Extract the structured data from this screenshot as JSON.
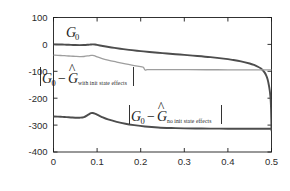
{
  "chart_data": {
    "type": "line",
    "title": "",
    "xlabel": "frequency",
    "ylabel": "Amplitude (dB)",
    "xlim": [
      0,
      0.5
    ],
    "ylim": [
      -400,
      100
    ],
    "xticks": [
      "0",
      "0.1",
      "0.2",
      "0.3",
      "0.4",
      "0.5"
    ],
    "xtick_values": [
      0,
      0.1,
      0.2,
      0.3,
      0.4,
      0.5
    ],
    "yticks": [
      "100",
      "0",
      "-100",
      "-200",
      "-300",
      "-400"
    ],
    "ytick_values": [
      100,
      0,
      -100,
      -200,
      -300,
      -400
    ],
    "grid": false,
    "legend_position": "none",
    "series": [
      {
        "name": "G_0",
        "color": "#4d4d4d",
        "width": 1.9,
        "x": [
          0.0,
          0.01,
          0.02,
          0.03,
          0.04,
          0.05,
          0.06,
          0.07,
          0.08,
          0.085,
          0.09,
          0.095,
          0.1,
          0.11,
          0.12,
          0.14,
          0.16,
          0.18,
          0.2,
          0.22,
          0.25,
          0.28,
          0.3,
          0.33,
          0.36,
          0.39,
          0.41,
          0.43,
          0.45,
          0.46,
          0.47,
          0.475,
          0.48,
          0.484,
          0.488,
          0.491,
          0.494,
          0.496,
          0.497,
          0.498,
          0.499,
          0.5
        ],
        "y": [
          0.0,
          -0.2,
          -0.6,
          -1.1,
          -1.7,
          -2.3,
          -2.6,
          -2.4,
          -1.3,
          -0.5,
          0.0,
          -0.6,
          -2.0,
          -5.0,
          -8.0,
          -13.0,
          -17.5,
          -21.5,
          -25.0,
          -28.2,
          -32.5,
          -36.5,
          -39.0,
          -43.0,
          -47.5,
          -53.0,
          -57.5,
          -63.0,
          -71.0,
          -76.5,
          -84.0,
          -89.0,
          -96.0,
          -104.0,
          -116.0,
          -130.0,
          -152.0,
          -172.0,
          -186.0,
          -205.0,
          -240.0,
          -320.0
        ]
      },
      {
        "name": "|G_0 - Ghat_with_init_state_effects|",
        "color": "#9e9e9e",
        "width": 1.3,
        "x": [
          0.0,
          0.01,
          0.02,
          0.03,
          0.04,
          0.05,
          0.06,
          0.07,
          0.08,
          0.086,
          0.09,
          0.095,
          0.1,
          0.11,
          0.125,
          0.145,
          0.165,
          0.185,
          0.2,
          0.206,
          0.21,
          0.215,
          0.225,
          0.25,
          0.28,
          0.31,
          0.35,
          0.4,
          0.44,
          0.47,
          0.49,
          0.5
        ],
        "y": [
          -40.0,
          -40.6,
          -41.6,
          -42.6,
          -43.6,
          -44.6,
          -45.4,
          -45.0,
          -42.5,
          -40.5,
          -41.0,
          -43.0,
          -46.5,
          -52.0,
          -58.5,
          -65.5,
          -72.0,
          -78.5,
          -83.0,
          -85.0,
          -95.0,
          -94.0,
          -93.5,
          -93.6,
          -93.8,
          -94.0,
          -94.2,
          -94.4,
          -94.6,
          -94.8,
          -95.0,
          -95.0
        ]
      },
      {
        "name": "|G_0 - Ghat_no_init_state_effects|",
        "color": "#4d4d4d",
        "width": 1.9,
        "x": [
          0.0,
          0.01,
          0.02,
          0.03,
          0.04,
          0.05,
          0.06,
          0.07,
          0.08,
          0.086,
          0.09,
          0.095,
          0.1,
          0.11,
          0.125,
          0.145,
          0.165,
          0.185,
          0.21,
          0.24,
          0.27,
          0.3,
          0.34,
          0.38,
          0.42,
          0.46,
          0.48,
          0.49,
          0.5
        ],
        "y": [
          -268.0,
          -268.5,
          -269.5,
          -270.5,
          -271.5,
          -272.5,
          -272.5,
          -270.0,
          -261.0,
          -255.5,
          -255.0,
          -257.0,
          -261.0,
          -269.0,
          -279.0,
          -288.0,
          -295.0,
          -300.0,
          -305.0,
          -309.0,
          -311.0,
          -312.0,
          -312.8,
          -313.2,
          -313.5,
          -313.7,
          -313.8,
          -313.8,
          -313.8
        ]
      }
    ],
    "annotations": [
      {
        "id": "g0-label",
        "text": "G₀",
        "base": "G",
        "sub": "0",
        "x": 0.5,
        "y": 57
      },
      {
        "id": "with-init-label",
        "text": "|G₀ − Ĝ with init state effects|",
        "base_left": "G",
        "sub_left": "0",
        "minus": "−",
        "base_right": "G",
        "sub_right": "with init state effects",
        "x": 0.05,
        "y": -108
      },
      {
        "id": "no-init-label",
        "text": "|G₀ − Ĝ no init state effects|",
        "base_left": "G",
        "sub_left": "0",
        "minus": "−",
        "base_right": "G",
        "sub_right": "no init state effects",
        "x": 0.28,
        "y": -262
      }
    ]
  },
  "figure": {
    "background_color": "#ffffff",
    "axis_color": "#1c1c1c",
    "curve_dark_color": "#4d4d4d",
    "curve_light_color": "#9e9e9e"
  }
}
